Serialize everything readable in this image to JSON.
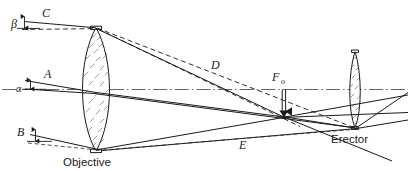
{
  "figure": {
    "background_color": "#ffffff",
    "line_color": "#1a1a1a",
    "axis_color": "#555555"
  },
  "components": [
    {
      "id": "objective",
      "label": "Objective",
      "type": "biconvex-lens",
      "label_position": "below"
    },
    {
      "id": "erector",
      "label": "Erector",
      "type": "biconvex-lens",
      "label_position": "below"
    }
  ],
  "ray_labels": [
    {
      "id": "ray-a",
      "text": "A",
      "description": "axial incoming ray bundle"
    },
    {
      "id": "ray-b",
      "text": "B",
      "description": "lower oblique ray bundle"
    },
    {
      "id": "ray-c",
      "text": "C",
      "description": "upper oblique ray bundle"
    },
    {
      "id": "ray-d",
      "text": "D",
      "description": "upper converging dashed ray"
    },
    {
      "id": "ray-e",
      "text": "E",
      "description": "lower converging dashed ray"
    }
  ],
  "angle_labels": [
    {
      "id": "alpha",
      "text": "α",
      "description": "axial field angle at objective"
    },
    {
      "id": "beta",
      "text": "β",
      "description": "oblique field angle at objective"
    }
  ],
  "focal_marker": {
    "id": "f-objective",
    "symbol": "F",
    "subscript": "o",
    "description": "rear focal plane of the objective, image height arrow"
  },
  "axis": {
    "id": "optical-axis",
    "style": "dash-dot",
    "description": "optical axis of the system"
  }
}
